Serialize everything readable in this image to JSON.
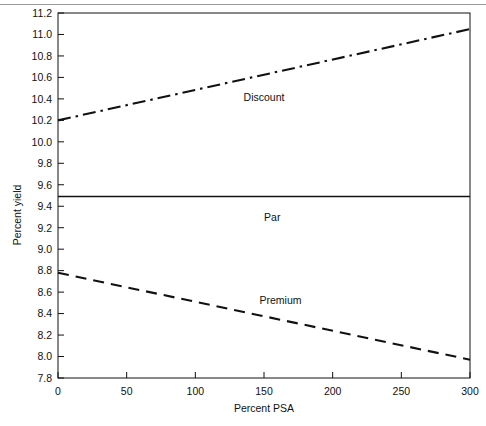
{
  "figure": {
    "name": "mortgage-yield-vs-psa-chart",
    "background": "#ffffff",
    "ink_color": "#111111",
    "scan_rule_color": "#9a9a9a"
  },
  "chart_data": {
    "type": "line",
    "title": "",
    "xlabel": "Percent PSA",
    "ylabel": "Percent yield",
    "xlim": [
      0,
      300
    ],
    "ylim": [
      7.8,
      11.2
    ],
    "grid": false,
    "legend_position": "inline-annotations",
    "xticks": [
      0,
      50,
      100,
      150,
      200,
      250,
      300
    ],
    "xticklabels": [
      "0",
      "50",
      "100",
      "150",
      "200",
      "250",
      "300"
    ],
    "yticks": [
      7.8,
      8.0,
      8.2,
      8.4,
      8.6,
      8.8,
      9.0,
      9.2,
      9.4,
      9.6,
      9.8,
      10.0,
      10.2,
      10.4,
      10.6,
      10.8,
      11.0,
      11.2
    ],
    "yticklabels": [
      "7.8",
      "8.0",
      "8.2",
      "8.4",
      "8.6",
      "8.8",
      "9.0",
      "9.2",
      "9.4",
      "9.6",
      "9.8",
      "10.0",
      "10.2",
      "10.4",
      "10.6",
      "10.8",
      "11.0",
      "11.2"
    ],
    "x": [
      0,
      300
    ],
    "series": [
      {
        "name": "Discount",
        "label": "Discount",
        "linestyle": "dashdot",
        "color": "#111111",
        "values": [
          10.2,
          11.05
        ],
        "label_x": 150,
        "label_y": 10.42
      },
      {
        "name": "Par",
        "label": "Par",
        "linestyle": "solid",
        "color": "#111111",
        "values": [
          9.49,
          9.49
        ],
        "label_x": 156,
        "label_y": 9.3
      },
      {
        "name": "Premium",
        "label": "Premium",
        "linestyle": "dashed",
        "color": "#111111",
        "values": [
          8.78,
          7.97
        ],
        "label_x": 162,
        "label_y": 8.53
      }
    ]
  }
}
